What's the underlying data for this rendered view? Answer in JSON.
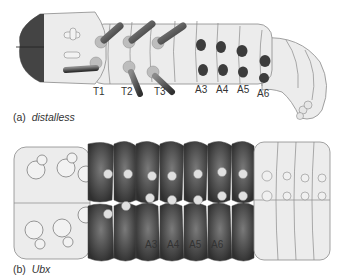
{
  "panel_a": {
    "caption_letter": "(a)",
    "caption_gene": "distalless",
    "thoracic_labels": [
      "T1",
      "T2",
      "T3"
    ],
    "abdominal_labels": [
      "A3",
      "A4",
      "A5",
      "A6"
    ]
  },
  "panel_b": {
    "caption_letter": "(b)",
    "caption_gene": "Ubx",
    "abdominal_labels": [
      "A3",
      "A4",
      "A5",
      "A6"
    ]
  },
  "colors": {
    "body": "#ececec",
    "outline": "#8a8a8a",
    "dark_stain": "#3c3c3c",
    "head_stain": "#444444",
    "leg_pad": "#bdbdbd"
  }
}
